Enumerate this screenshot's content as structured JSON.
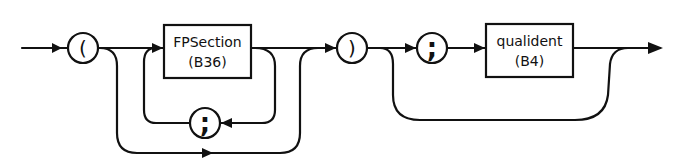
{
  "diagram": {
    "type": "syntax-diagram",
    "colors": {
      "stroke": "#111111",
      "background": "#ffffff"
    },
    "terminals": {
      "open_paren": "(",
      "close_paren": ")",
      "semicolon_loop": ";",
      "semicolon_result": ";"
    },
    "nonterminals": {
      "fpsection": {
        "name": "FPSection",
        "ref": "(B36)"
      },
      "qualident": {
        "name": "qualident",
        "ref": "(B4)"
      }
    }
  }
}
